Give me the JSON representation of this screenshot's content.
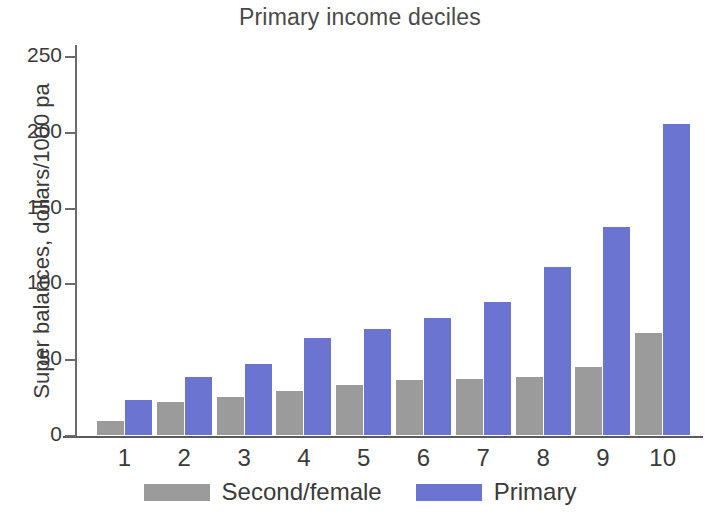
{
  "chart_data": {
    "type": "bar",
    "title": "Primary income deciles",
    "xlabel": "",
    "ylabel": "Super balances, dollars/1000 pa",
    "categories": [
      "1",
      "2",
      "3",
      "4",
      "5",
      "6",
      "7",
      "8",
      "9",
      "10"
    ],
    "yticks": [
      0,
      50,
      100,
      150,
      200,
      250
    ],
    "ylim": [
      0,
      258
    ],
    "grid": false,
    "legend_position": "bottom",
    "series": [
      {
        "name": "Second/female",
        "color": "#9b9b9b",
        "values": [
          9.5,
          22,
          25,
          29,
          33,
          36,
          37,
          38,
          45,
          67
        ]
      },
      {
        "name": "Primary",
        "color": "#6b74d0",
        "values": [
          23,
          38,
          47,
          64,
          70,
          77,
          88,
          111,
          137,
          205
        ]
      }
    ]
  },
  "axis": {
    "tick_labels": [
      "250",
      "200",
      "150",
      "100",
      "50",
      "0"
    ]
  },
  "legend": {
    "items": [
      {
        "label": "Second/female",
        "swatch": "second"
      },
      {
        "label": "Primary",
        "swatch": "primary"
      }
    ]
  }
}
